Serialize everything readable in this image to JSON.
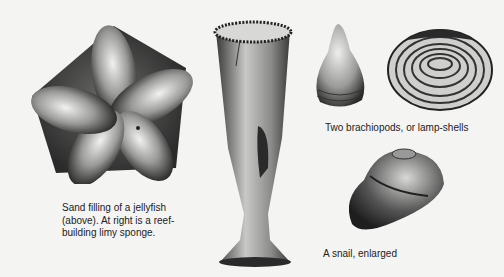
{
  "figures": [
    {
      "id": "jellyfish",
      "subject": "Sand filling of a jellyfish",
      "icon": "jellyfish-fossil-illustration"
    },
    {
      "id": "sponge",
      "subject": "Reef-building limy sponge",
      "icon": "sponge-fossil-illustration"
    },
    {
      "id": "brachiopod-1",
      "subject": "Brachiopod (side view)",
      "icon": "brachiopod-conical-illustration"
    },
    {
      "id": "brachiopod-2",
      "subject": "Brachiopod (ribbed valve)",
      "icon": "brachiopod-ribbed-illustration"
    },
    {
      "id": "snail",
      "subject": "Snail, enlarged",
      "icon": "snail-fossil-illustration"
    }
  ],
  "captions": {
    "jellyfish": {
      "line1": "Sand filling of a jellyfish",
      "line2": "(above). At right is a reef-",
      "line3": "building limy sponge."
    },
    "brachiopods": "Two brachiopods, or lamp-shells",
    "snail": "A snail, enlarged"
  },
  "colors": {
    "paper": "#f4f4f2",
    "ink": "#1e1e1e"
  }
}
